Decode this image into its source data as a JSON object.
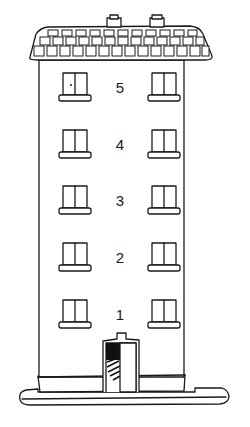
{
  "illustration": {
    "subject": "five-story apartment building",
    "floors": [
      {
        "number": "5",
        "top": 80
      },
      {
        "number": "4",
        "top": 137
      },
      {
        "number": "3",
        "top": 193
      },
      {
        "number": "2",
        "top": 250
      },
      {
        "number": "1",
        "top": 307
      }
    ],
    "colors": {
      "line": "#1a1a1a",
      "background": "#ffffff",
      "door_shadow": "#111111"
    }
  }
}
